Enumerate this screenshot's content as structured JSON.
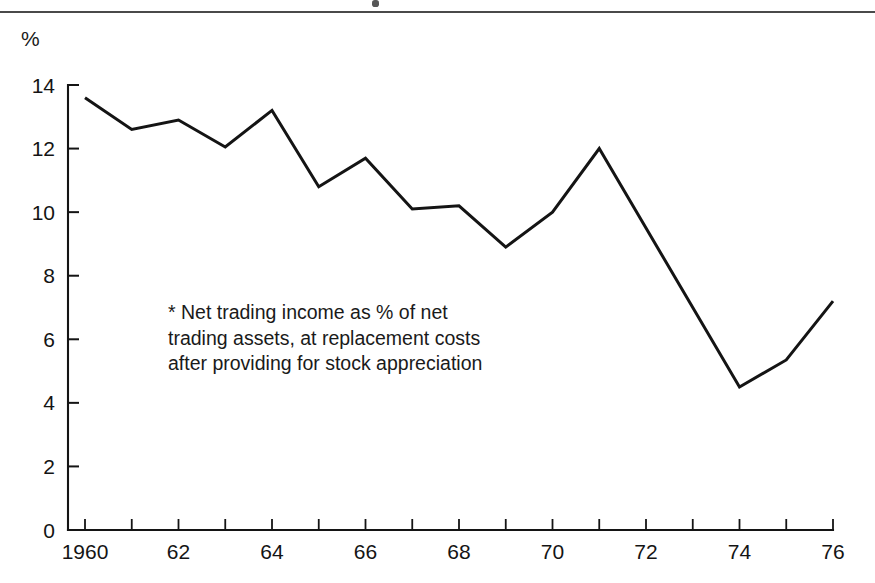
{
  "figure": {
    "unit_label": "%",
    "footnote": "* Net trading income as % of net trading assets, at replacement costs after providing for stock appreciation"
  },
  "chart_data": {
    "type": "line",
    "title": "",
    "subtitle": "",
    "xlabel": "",
    "ylabel": "%",
    "xlim": [
      1960,
      1976
    ],
    "ylim": [
      0,
      14
    ],
    "grid": false,
    "legend": null,
    "y_ticks": [
      0,
      2,
      4,
      6,
      8,
      10,
      12,
      14
    ],
    "y_tick_labels": [
      "0",
      "2",
      "4",
      "6",
      "8",
      "10",
      "12",
      "14"
    ],
    "x_ticks": [
      1960,
      1961,
      1962,
      1963,
      1964,
      1965,
      1966,
      1967,
      1968,
      1969,
      1970,
      1971,
      1972,
      1973,
      1974,
      1975,
      1976
    ],
    "x_tick_labels": [
      "1960",
      "",
      "62",
      "",
      "64",
      "",
      "66",
      "",
      "68",
      "",
      "70",
      "",
      "72",
      "",
      "74",
      "",
      "76"
    ],
    "x": [
      1960,
      1961,
      1962,
      1963,
      1964,
      1965,
      1966,
      1967,
      1968,
      1969,
      1970,
      1971,
      1974,
      1975,
      1976
    ],
    "values": [
      13.6,
      12.6,
      12.9,
      12.05,
      13.2,
      10.8,
      11.7,
      10.1,
      10.2,
      8.9,
      10.0,
      12.0,
      4.5,
      5.35,
      7.2
    ],
    "series": [
      {
        "name": "Net trading income as % of net trading assets",
        "points": [
          {
            "x": 1960,
            "y": 13.6
          },
          {
            "x": 1961,
            "y": 12.6
          },
          {
            "x": 1962,
            "y": 12.9
          },
          {
            "x": 1963,
            "y": 12.05
          },
          {
            "x": 1964,
            "y": 13.2
          },
          {
            "x": 1965,
            "y": 10.8
          },
          {
            "x": 1966,
            "y": 11.7
          },
          {
            "x": 1967,
            "y": 10.1
          },
          {
            "x": 1968,
            "y": 10.2
          },
          {
            "x": 1969,
            "y": 8.9
          },
          {
            "x": 1970,
            "y": 10.0
          },
          {
            "x": 1971,
            "y": 12.0
          },
          {
            "x": 1974,
            "y": 4.5
          },
          {
            "x": 1975,
            "y": 5.35
          },
          {
            "x": 1976,
            "y": 7.2
          }
        ]
      }
    ]
  },
  "colors": {
    "line": "#141414",
    "axis": "#141414",
    "rule": "#4a4a4a",
    "background": "#ffffff"
  }
}
